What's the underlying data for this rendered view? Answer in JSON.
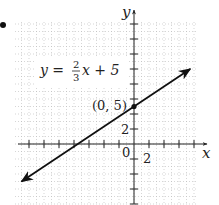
{
  "chart_data": {
    "type": "line",
    "title": "",
    "equation": "y = (2/3)x + 5",
    "equation_label": {
      "lhs": "y =",
      "num": "2",
      "den": "3",
      "rhs": "x + 5"
    },
    "xlabel": "x",
    "ylabel": "y",
    "x_tick_label": "2",
    "y_tick_label": "2",
    "origin_label": "0",
    "tick_step": 2,
    "grid": "dotted",
    "xlim": [
      -16,
      9
    ],
    "ylim": [
      -8,
      17
    ],
    "series": [
      {
        "name": "y = 2/3 x + 5",
        "slope": 0.6667,
        "intercept": 5,
        "x": [
          -15,
          7.5
        ],
        "y": [
          -5,
          10
        ],
        "arrows": "both"
      }
    ],
    "points": [
      {
        "x": 0,
        "y": 5,
        "label": "(0, 5)"
      }
    ],
    "colors": {
      "line": "#111111",
      "grid": "#bbbbbb",
      "axis": "#222222"
    }
  }
}
